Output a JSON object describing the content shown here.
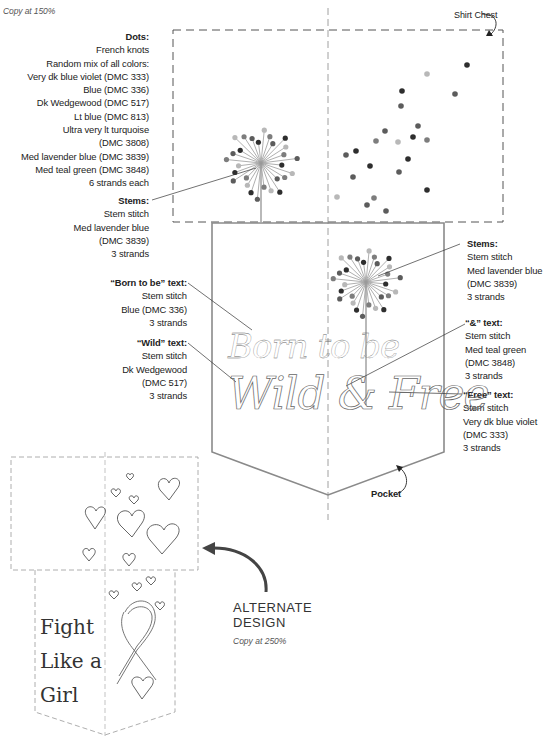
{
  "header": {
    "copy_note": "Copy at 150%"
  },
  "labels": {
    "shirt_chest": "Shirt Chest",
    "pocket": "Pocket"
  },
  "notes": {
    "dots": {
      "title": "Dots:",
      "lines": [
        "French knots",
        "Random mix of all colors:",
        "Very dk blue violet (DMC 333)",
        "Blue (DMC 336)",
        "Dk Wedgewood (DMC 517)",
        "Lt blue (DMC 813)",
        "Ultra very lt turquoise",
        "(DMC 3808)",
        "Med lavender blue (DMC 3839)",
        "Med teal green (DMC 3848)",
        "6 strands each"
      ]
    },
    "stems_left": {
      "title": "Stems:",
      "lines": [
        "Stem stitch",
        "Med lavender blue",
        "(DMC 3839)",
        "3 strands"
      ]
    },
    "born_to_be": {
      "title": "“Born to be” text:",
      "lines": [
        "Stem stitch",
        "Blue (DMC 336)",
        "3 strands"
      ]
    },
    "wild": {
      "title": "“Wild” text:",
      "lines": [
        "Stem stitch",
        "Dk Wedgewood",
        "(DMC 517)",
        "3 strands"
      ]
    },
    "stems_right": {
      "title": "Stems:",
      "lines": [
        "Stem stitch",
        "Med lavender blue",
        "(DMC 3839)",
        "3 strands"
      ]
    },
    "ampersand": {
      "title": "“&” text:",
      "lines": [
        "Stem stitch",
        "Med teal green",
        "(DMC 3848)",
        "3 strands"
      ]
    },
    "free": {
      "title": "“Free” text:",
      "lines": [
        "Stem stitch",
        "Very dk blue violet",
        "(DMC 333)",
        "3 strands"
      ]
    }
  },
  "pocket_text": {
    "line1": "Born to be",
    "line2": "Wild & Free"
  },
  "alternate": {
    "title_line1": "ALTERNATE",
    "title_line2": "DESIGN",
    "copy_note": "Copy at 250%",
    "text_lines": [
      "Fight",
      "Like a",
      "Girl"
    ]
  },
  "colors": {
    "ink": "#222222",
    "line": "#8a8a8a",
    "dot_dark": "#2e2e2e",
    "dot_mid": "#5c5c5c",
    "dot_gray": "#7d7d7d",
    "dot_light": "#b8b8b8"
  }
}
